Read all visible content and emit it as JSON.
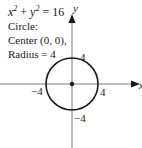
{
  "equation": {
    "x_term": "x",
    "y_term": "y",
    "exp": "2",
    "plus": " + ",
    "rhs": " = 16"
  },
  "description": {
    "line1": "Circle:",
    "line2": "Center (0, 0),",
    "line3": "Radius = 4"
  },
  "axes": {
    "x_label": "x",
    "y_label": "y"
  },
  "ticks": {
    "top": "4",
    "bottom": "−4",
    "left": "−4",
    "right": "4"
  },
  "colors": {
    "stroke": "#1a1a1a",
    "background": "#ffffff"
  }
}
